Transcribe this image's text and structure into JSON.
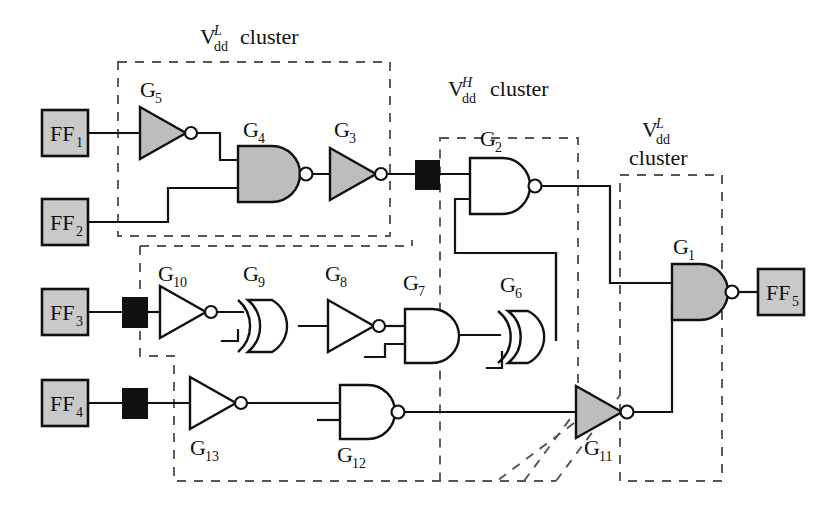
{
  "diagram": {
    "background_color": "#ffffff",
    "line_color": "#111111",
    "gate_fill_gray": "#bdbdbd",
    "gate_fill_white": "#ffffff",
    "levelshifter_color": "#111111",
    "dashed_color": "#555555"
  },
  "clusters": [
    {
      "id": "cluster-vddl-top",
      "label_main": "V",
      "label_sub": "dd",
      "label_sup": "L",
      "label_tail": "cluster",
      "voltage": "VddL"
    },
    {
      "id": "cluster-vddh-mid",
      "label_main": "V",
      "label_sub": "dd",
      "label_sup": "H",
      "label_tail": "cluster",
      "voltage": "VddH"
    },
    {
      "id": "cluster-vddl-right",
      "label_main": "V",
      "label_sub": "dd",
      "label_sup": "L",
      "label_tail": "cluster",
      "voltage": "VddL"
    }
  ],
  "flipflops": [
    {
      "id": "ff1",
      "main": "FF",
      "sub": "1"
    },
    {
      "id": "ff2",
      "main": "FF",
      "sub": "2"
    },
    {
      "id": "ff3",
      "main": "FF",
      "sub": "3"
    },
    {
      "id": "ff4",
      "main": "FF",
      "sub": "4"
    },
    {
      "id": "ff5",
      "main": "FF",
      "sub": "5"
    }
  ],
  "gates": [
    {
      "id": "g1",
      "main": "G",
      "sub": "1",
      "type": "nand",
      "shaded": true
    },
    {
      "id": "g2",
      "main": "G",
      "sub": "2",
      "type": "nand",
      "shaded": false
    },
    {
      "id": "g3",
      "main": "G",
      "sub": "3",
      "type": "inverter",
      "shaded": true
    },
    {
      "id": "g4",
      "main": "G",
      "sub": "4",
      "type": "nand",
      "shaded": true
    },
    {
      "id": "g5",
      "main": "G",
      "sub": "5",
      "type": "inverter",
      "shaded": true
    },
    {
      "id": "g6",
      "main": "G",
      "sub": "6",
      "type": "xor",
      "shaded": false
    },
    {
      "id": "g7",
      "main": "G",
      "sub": "7",
      "type": "and",
      "shaded": false
    },
    {
      "id": "g8",
      "main": "G",
      "sub": "8",
      "type": "inverter",
      "shaded": false
    },
    {
      "id": "g9",
      "main": "G",
      "sub": "9",
      "type": "xor",
      "shaded": false
    },
    {
      "id": "g10",
      "main": "G",
      "sub": "10",
      "type": "inverter",
      "shaded": false
    },
    {
      "id": "g11",
      "main": "G",
      "sub": "11",
      "type": "inverter",
      "shaded": true
    },
    {
      "id": "g12",
      "main": "G",
      "sub": "12",
      "type": "nand",
      "shaded": false
    },
    {
      "id": "g13",
      "main": "G",
      "sub": "13",
      "type": "inverter",
      "shaded": false
    }
  ],
  "level_shifters": [
    {
      "id": "ls-g3-out",
      "note": "between G3 and G2"
    },
    {
      "id": "ls-ff3-out",
      "note": "after FF3"
    },
    {
      "id": "ls-ff4-out",
      "note": "after FF4"
    }
  ]
}
